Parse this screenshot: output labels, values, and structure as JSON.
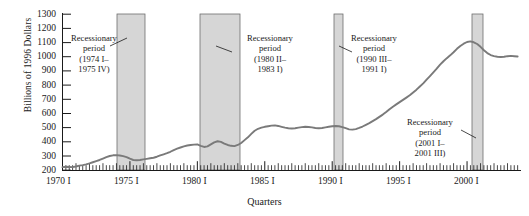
{
  "chart_data": {
    "type": "line",
    "title": "",
    "xlabel": "Quarters",
    "ylabel": "Billions of 1996 Dollars",
    "ylim": [
      200,
      1300
    ],
    "ytick_labels": [
      "1300",
      "1200",
      "1100",
      "1000",
      "900",
      "800",
      "700",
      "600",
      "500",
      "400",
      "300",
      "200"
    ],
    "ytick_values": [
      1300,
      1200,
      1100,
      1000,
      900,
      800,
      700,
      600,
      500,
      400,
      300,
      200
    ],
    "xlim": [
      "1970 I",
      "2003 IV"
    ],
    "xtick_labels": [
      "1970 I",
      "1975 I",
      "1980 I",
      "1985 I",
      "1990 I",
      "1995 I",
      "2000 I"
    ],
    "xtick_years": [
      1970,
      1975,
      1980,
      1985,
      1990,
      1995,
      2000
    ],
    "grid": false,
    "legend": "none",
    "minor_ticks": "quarterly",
    "series": [
      {
        "name": "Business fixed investment",
        "color": "#7a7a7a",
        "x": [
          1970.0,
          1970.25,
          1970.5,
          1970.75,
          1971.0,
          1971.25,
          1971.5,
          1971.75,
          1972.0,
          1972.25,
          1972.5,
          1972.75,
          1973.0,
          1973.25,
          1973.5,
          1973.75,
          1974.0,
          1974.25,
          1974.5,
          1974.75,
          1975.0,
          1975.25,
          1975.5,
          1975.75,
          1976.0,
          1976.25,
          1976.5,
          1976.75,
          1977.0,
          1977.25,
          1977.5,
          1977.75,
          1978.0,
          1978.25,
          1978.5,
          1978.75,
          1979.0,
          1979.25,
          1979.5,
          1979.75,
          1980.0,
          1980.25,
          1980.5,
          1980.75,
          1981.0,
          1981.25,
          1981.5,
          1981.75,
          1982.0,
          1982.25,
          1982.5,
          1982.75,
          1983.0,
          1983.25,
          1983.5,
          1983.75,
          1984.0,
          1984.25,
          1984.5,
          1984.75,
          1985.0,
          1985.25,
          1985.5,
          1985.75,
          1986.0,
          1986.25,
          1986.5,
          1986.75,
          1987.0,
          1987.25,
          1987.5,
          1987.75,
          1988.0,
          1988.25,
          1988.5,
          1988.75,
          1989.0,
          1989.25,
          1989.5,
          1989.75,
          1990.0,
          1990.25,
          1990.5,
          1990.75,
          1991.0,
          1991.25,
          1991.5,
          1991.75,
          1992.0,
          1992.25,
          1992.5,
          1992.75,
          1993.0,
          1993.25,
          1993.5,
          1993.75,
          1994.0,
          1994.25,
          1994.5,
          1994.75,
          1995.0,
          1995.25,
          1995.5,
          1995.75,
          1996.0,
          1996.25,
          1996.5,
          1996.75,
          1997.0,
          1997.25,
          1997.5,
          1997.75,
          1998.0,
          1998.25,
          1998.5,
          1998.75,
          1999.0,
          1999.25,
          1999.5,
          1999.75,
          2000.0,
          2000.25,
          2000.5,
          2000.75,
          2001.0,
          2001.25,
          2001.5,
          2001.75,
          2002.0,
          2002.25,
          2002.5,
          2002.75,
          2003.0,
          2003.25,
          2003.5,
          2003.75
        ],
        "y": [
          222,
          224,
          223,
          222,
          226,
          232,
          236,
          241,
          248,
          256,
          264,
          272,
          282,
          292,
          300,
          305,
          306,
          304,
          299,
          292,
          281,
          272,
          270,
          272,
          276,
          280,
          284,
          288,
          295,
          304,
          312,
          320,
          330,
          342,
          352,
          360,
          368,
          374,
          378,
          380,
          382,
          372,
          364,
          368,
          382,
          396,
          404,
          400,
          388,
          378,
          372,
          370,
          378,
          392,
          412,
          432,
          456,
          478,
          492,
          500,
          506,
          510,
          514,
          516,
          512,
          506,
          500,
          496,
          494,
          496,
          500,
          504,
          506,
          505,
          502,
          498,
          496,
          498,
          502,
          506,
          510,
          512,
          510,
          504,
          496,
          488,
          486,
          490,
          498,
          508,
          520,
          532,
          546,
          560,
          576,
          592,
          610,
          630,
          648,
          664,
          680,
          696,
          712,
          728,
          748,
          768,
          790,
          812,
          838,
          864,
          890,
          916,
          944,
          968,
          990,
          1010,
          1032,
          1056,
          1076,
          1092,
          1104,
          1108,
          1102,
          1090,
          1070,
          1046,
          1026,
          1012,
          1004,
          1000,
          998,
          1000,
          1004,
          1006,
          1004,
          1002
        ]
      }
    ],
    "shaded_regions": [
      {
        "name": "recession-1",
        "start": 1974.0,
        "end": 1975.75,
        "color": "#d6d6d6"
      },
      {
        "name": "recession-2",
        "start": 1980.25,
        "end": 1983.0,
        "color": "#d6d6d6"
      },
      {
        "name": "recession-3",
        "start": 1990.5,
        "end": 1991.0,
        "color": "#d6d6d6"
      },
      {
        "name": "recession-4",
        "start": 2001.0,
        "end": 2001.5,
        "color": "#d6d6d6"
      }
    ],
    "annotations": [
      {
        "name": "recession-annotation-1",
        "lines": [
          "Recessionary",
          "period",
          "(1974 I–",
          "1975 IV)"
        ],
        "leader": true
      },
      {
        "name": "recession-annotation-2",
        "lines": [
          "Recessionary",
          "period",
          "(1980 II–",
          "1983 I)"
        ],
        "leader": true
      },
      {
        "name": "recession-annotation-3",
        "lines": [
          "Recessionary",
          "period",
          "(1990 III–",
          "1991 I)"
        ],
        "leader": true
      },
      {
        "name": "recession-annotation-4",
        "lines": [
          "Recessionary",
          "period",
          "(2001 I–",
          "2001 III)"
        ],
        "leader": true
      }
    ]
  }
}
